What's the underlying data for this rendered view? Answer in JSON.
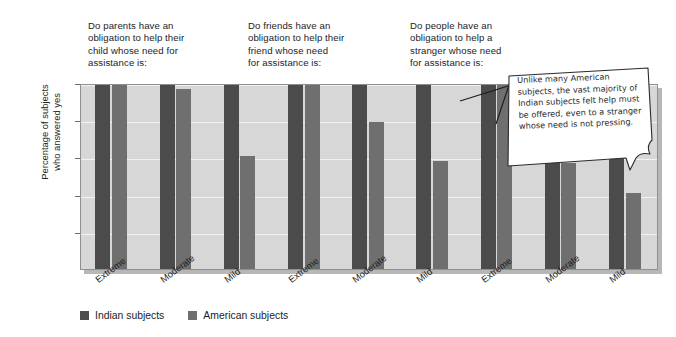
{
  "group_headings": [
    "Do parents have an\nobligation to help their\nchild whose need for\nassistance is:",
    "Do friends have an\nobligation to help their\nfriend whose need\nfor assistance is:",
    "Do people have an\nobligation to help a\nstranger whose need\nfor assistance is:"
  ],
  "callout": {
    "text": "Unlike many American subjects, the vast majority of Indian subjects felt help must be offered, even to a stranger whose need is not pressing."
  },
  "legend": {
    "entries": [
      {
        "label": "Indian subjects",
        "color": "#4b4b4b"
      },
      {
        "label": "American subjects",
        "color": "#6f6f6f"
      }
    ]
  },
  "colors": {
    "indian": "#4b4b4b",
    "american": "#6f6f6f",
    "plot_background": "#d7d7d7",
    "gridline": "#f2f2f2",
    "page_background": "#ffffff",
    "text": "#1d1d1d"
  },
  "chart_data": {
    "type": "bar",
    "title": "",
    "xlabel": "",
    "ylabel": "Percentage of subjects\nwho answered yes",
    "ylim": [
      0,
      100
    ],
    "yticks": [
      20,
      40,
      60,
      80,
      100
    ],
    "grid": true,
    "legend_position": "below",
    "categories": [
      "Extreme",
      "Moderate",
      "Mild",
      "Extreme",
      "Moderate",
      "Mild",
      "Extreme",
      "Moderate",
      "Mild"
    ],
    "groups": [
      {
        "heading": "Do parents have an obligation to help their child whose need for assistance is:",
        "categories": [
          "Extreme",
          "Moderate",
          "Mild"
        ]
      },
      {
        "heading": "Do friends have an obligation to help their friend whose need for assistance is:",
        "categories": [
          "Extreme",
          "Moderate",
          "Mild"
        ]
      },
      {
        "heading": "Do people have an obligation to help a stranger whose need for assistance is:",
        "categories": [
          "Extreme",
          "Moderate",
          "Mild"
        ]
      }
    ],
    "series": [
      {
        "name": "Indian subjects",
        "color": "#4b4b4b",
        "values": [
          100,
          100,
          99,
          100,
          100,
          100,
          100,
          100,
          84
        ]
      },
      {
        "name": "American subjects",
        "color": "#6f6f6f",
        "values": [
          100,
          97,
          61,
          99,
          79,
          58,
          99,
          57,
          41
        ]
      }
    ]
  }
}
